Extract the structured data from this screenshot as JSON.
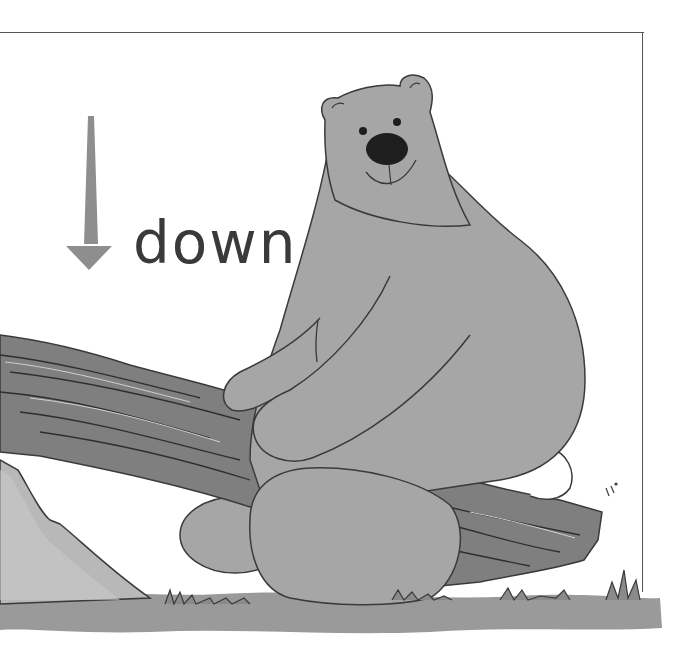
{
  "illustration": {
    "subject": "bear sitting on a log",
    "label": "down",
    "arrow_direction": "down",
    "colors": {
      "bear_fill": "#a6a6a6",
      "nose": "#1e1e1e",
      "outline": "#3a3a3a",
      "log_fill": "#7f7f7f",
      "ground": "#9a9a9a",
      "rock": "#b8b8b8",
      "arrow": "#8e8e8e",
      "text": "#3a3a3a",
      "background": "#ffffff"
    }
  }
}
